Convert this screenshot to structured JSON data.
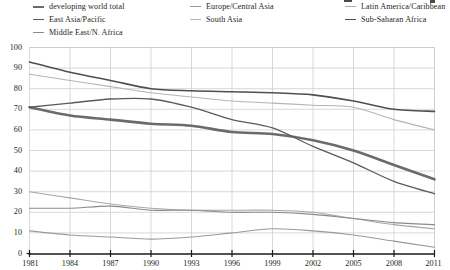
{
  "legend": {
    "columns": [
      [
        {
          "label": "developing world total",
          "color": "#6b6b6b",
          "width": 2.6,
          "name": "legend-developing-world-total"
        },
        {
          "label": "East Asia/Pacific",
          "color": "#5a5a5a",
          "width": 1.3,
          "name": "legend-east-asia-pacific"
        },
        {
          "label": "Middle East/N. Africa",
          "color": "#8a8a8a",
          "width": 1.1,
          "name": "legend-middle-east-n-africa"
        }
      ],
      [
        {
          "label": "Europe/Central Asia",
          "color": "#9a9a9a",
          "width": 1.1,
          "name": "legend-europe-central-asia"
        },
        {
          "label": "South Asia",
          "color": "#b4b4b4",
          "width": 1.1,
          "name": "legend-south-asia"
        }
      ],
      [
        {
          "label": "Latin America/Caribbean",
          "color": "#a8a8a8",
          "width": 1.1,
          "name": "legend-latin-america-caribbean"
        },
        {
          "label": "Sub-Saharan Africa",
          "color": "#4f4f4f",
          "width": 1.6,
          "name": "legend-sub-saharan-africa"
        }
      ]
    ]
  },
  "chart_data": {
    "type": "line",
    "title": "",
    "xlabel": "",
    "ylabel": "",
    "xlim": [
      1981,
      2011
    ],
    "ylim": [
      0,
      100
    ],
    "ytick_step": 10,
    "yticks": [
      0,
      10,
      20,
      30,
      40,
      50,
      60,
      70,
      80,
      90,
      100
    ],
    "xticks": [
      1981,
      1984,
      1987,
      1990,
      1993,
      1996,
      1999,
      2002,
      2005,
      2008,
      2011
    ],
    "grid": true,
    "legend_position": "above-plot",
    "x": [
      1981,
      1984,
      1987,
      1990,
      1993,
      1996,
      1999,
      2002,
      2005,
      2008,
      2011
    ],
    "series": [
      {
        "name": "Sub-Saharan Africa",
        "color": "#4f4f4f",
        "width": 1.6,
        "values": [
          93,
          88,
          84,
          80,
          79,
          78.5,
          78,
          77,
          74,
          70,
          69
        ]
      },
      {
        "name": "South Asia",
        "color": "#b4b4b4",
        "width": 1.1,
        "values": [
          87,
          84,
          81,
          78,
          76,
          74,
          73,
          72,
          71,
          65,
          60
        ]
      },
      {
        "name": "developing world total",
        "color": "#6b6b6b",
        "width": 2.6,
        "values": [
          71,
          67,
          65,
          63,
          62,
          59,
          58,
          55,
          50,
          43,
          36
        ]
      },
      {
        "name": "East Asia/Pacific",
        "color": "#5a5a5a",
        "width": 1.3,
        "values": [
          71,
          73,
          75,
          75,
          71,
          65,
          61,
          52,
          44,
          35,
          29
        ]
      },
      {
        "name": "Latin America/Caribbean",
        "color": "#a8a8a8",
        "width": 1.1,
        "values": [
          30,
          27,
          24,
          22,
          21,
          21,
          21,
          20,
          17,
          14,
          12
        ]
      },
      {
        "name": "Middle East/N. Africa",
        "color": "#8a8a8a",
        "width": 1.1,
        "values": [
          22,
          22,
          23,
          21,
          21,
          20,
          20,
          19,
          17,
          15,
          14
        ]
      },
      {
        "name": "Europe/Central Asia",
        "color": "#9a9a9a",
        "width": 1.1,
        "values": [
          11,
          9,
          8,
          7,
          8,
          10,
          12,
          11,
          9,
          6,
          3
        ]
      }
    ]
  }
}
